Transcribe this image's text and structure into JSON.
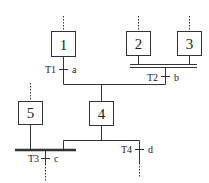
{
  "diagram": {
    "type": "grafcet",
    "steps": [
      {
        "id": "1",
        "label": "1"
      },
      {
        "id": "2",
        "label": "2"
      },
      {
        "id": "3",
        "label": "3"
      },
      {
        "id": "4",
        "label": "4"
      },
      {
        "id": "5",
        "label": "5"
      }
    ],
    "transitions": [
      {
        "id": "T1",
        "label": "T1",
        "condition": "a"
      },
      {
        "id": "T2",
        "label": "T2",
        "condition": "b"
      },
      {
        "id": "T3",
        "label": "T3",
        "condition": "c"
      },
      {
        "id": "T4",
        "label": "T4",
        "condition": "d"
      }
    ],
    "colors": {
      "line": "#333333",
      "background": "#ffffff"
    }
  }
}
